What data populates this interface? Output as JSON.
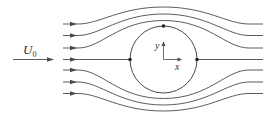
{
  "diagram": {
    "freestream_label": "U",
    "freestream_subscript": "0",
    "axis_x_label": "x",
    "axis_y_label": "y",
    "colors": {
      "line": "#4a4a4a",
      "background": "#ffffff"
    },
    "cylinder": {
      "cx": 163.5,
      "cy": 59.5,
      "r": 33.5
    },
    "stagnation_points": [
      {
        "name": "front",
        "x": 130,
        "y": 59.5
      },
      {
        "name": "rear",
        "x": 197,
        "y": 59.5
      },
      {
        "name": "top",
        "x": 163.5,
        "y": 26
      }
    ],
    "streamline_count": 7,
    "streamlines": [
      {
        "id": "upper-3",
        "y_far": 24,
        "y_peak": 7
      },
      {
        "id": "upper-2",
        "y_far": 35.5,
        "y_peak": 14
      },
      {
        "id": "upper-1",
        "y_far": 48,
        "y_peak": 20.5
      },
      {
        "id": "center",
        "y_far": 59.5,
        "y_peak": 59.5
      },
      {
        "id": "lower-1",
        "y_far": 70,
        "y_peak": 98.5
      },
      {
        "id": "lower-2",
        "y_far": 82,
        "y_peak": 105
      },
      {
        "id": "lower-3",
        "y_far": 93.5,
        "y_peak": 111
      }
    ]
  }
}
